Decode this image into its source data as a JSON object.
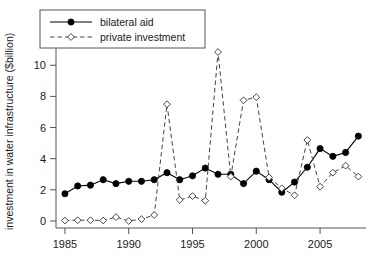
{
  "chart_data": {
    "type": "line",
    "title": "",
    "xlabel": "",
    "ylabel": "investment in water infrastructure ($billion)",
    "xlim": [
      1984.3,
      2008.6
    ],
    "ylim": [
      -0.45,
      11.3
    ],
    "grid": false,
    "legend_position": "top-left",
    "xticks": [
      1985,
      1990,
      1995,
      2000,
      2005
    ],
    "xtick_labels": [
      "1985",
      "1990",
      "1995",
      "2000",
      "2005"
    ],
    "yticks": [
      0,
      2,
      4,
      6,
      8,
      10
    ],
    "ytick_labels": [
      "0",
      "2",
      "4",
      "6",
      "8",
      "10"
    ],
    "x": [
      1985,
      1986,
      1987,
      1988,
      1989,
      1990,
      1991,
      1992,
      1993,
      1994,
      1995,
      1996,
      1997,
      1998,
      1999,
      2000,
      2001,
      2002,
      2003,
      2004,
      2005,
      2006,
      2007,
      2008
    ],
    "series": [
      {
        "name": "bilateral aid",
        "marker": "filled-circle",
        "line_style": "solid",
        "color": "#000000",
        "values": [
          1.75,
          2.25,
          2.3,
          2.65,
          2.4,
          2.55,
          2.55,
          2.65,
          3.1,
          2.65,
          2.9,
          3.4,
          3.0,
          3.0,
          2.4,
          3.2,
          2.65,
          1.85,
          2.5,
          3.45,
          4.65,
          4.15,
          4.4,
          5.45
        ]
      },
      {
        "name": "private investment",
        "marker": "open-diamond",
        "line_style": "dashed",
        "color": "#444444",
        "values": [
          0.03,
          0.05,
          0.05,
          0.03,
          0.25,
          0.0,
          0.12,
          0.38,
          7.5,
          1.35,
          1.6,
          1.3,
          10.85,
          2.85,
          7.75,
          7.95,
          2.8,
          2.1,
          1.65,
          5.2,
          2.2,
          3.1,
          3.55,
          2.85
        ]
      }
    ],
    "legend": [
      {
        "label": "bilateral aid",
        "marker": "filled-circle",
        "line_style": "solid"
      },
      {
        "label": "private investment",
        "marker": "open-diamond",
        "line_style": "dashed"
      }
    ]
  }
}
